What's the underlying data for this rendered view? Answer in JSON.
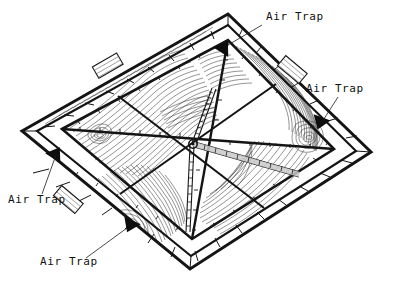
{
  "figure": {
    "kind": "engineering-diagram",
    "background_color": "#ffffff",
    "line_color": "#111111",
    "contour_color": "#333333",
    "frame_color": "#1a1a1a"
  },
  "annotations": [
    {
      "id": "air-trap-top",
      "label": "Air Trap",
      "text_x": 266,
      "text_y": 20,
      "leader": {
        "x1": 262,
        "y1": 25,
        "x2": 228,
        "y2": 45
      },
      "marker": {
        "x": 224,
        "y": 47,
        "rotation": 33
      }
    },
    {
      "id": "air-trap-right",
      "label": "Air Trap",
      "text_x": 306,
      "text_y": 92,
      "leader": {
        "x1": 338,
        "y1": 97,
        "x2": 322,
        "y2": 122
      },
      "marker": {
        "x": 320,
        "y": 123,
        "rotation": 200
      }
    },
    {
      "id": "air-trap-left",
      "label": "Air Trap",
      "text_x": 8,
      "text_y": 203,
      "leader": {
        "x1": 42,
        "y1": 194,
        "x2": 56,
        "y2": 155
      },
      "marker": {
        "x": 56,
        "y": 153,
        "rotation": 33
      }
    },
    {
      "id": "air-trap-bottom",
      "label": "Air Trap",
      "text_x": 40,
      "text_y": 265,
      "leader": {
        "x1": 86,
        "y1": 258,
        "x2": 127,
        "y2": 228
      },
      "marker": {
        "x": 130,
        "y": 226,
        "rotation": 205
      }
    }
  ],
  "frame": {
    "outer": [
      {
        "x": 22,
        "y": 131
      },
      {
        "x": 228,
        "y": 14
      },
      {
        "x": 371,
        "y": 152
      },
      {
        "x": 190,
        "y": 269
      }
    ],
    "inner": [
      {
        "x": 37,
        "y": 131
      },
      {
        "x": 228,
        "y": 25
      },
      {
        "x": 356,
        "y": 151
      },
      {
        "x": 191,
        "y": 256
      }
    ],
    "panel": [
      {
        "x": 62,
        "y": 129
      },
      {
        "x": 228,
        "y": 40
      },
      {
        "x": 334,
        "y": 149
      },
      {
        "x": 192,
        "y": 239
      }
    ]
  },
  "vents": [
    {
      "id": "vent-upper-left",
      "x": 108,
      "y": 66,
      "w": 28,
      "h": 13,
      "rotation": -30
    },
    {
      "id": "vent-upper-right",
      "x": 292,
      "y": 70,
      "w": 28,
      "h": 13,
      "rotation": 40
    },
    {
      "id": "vent-lower-left",
      "x": 68,
      "y": 200,
      "w": 28,
      "h": 13,
      "rotation": 40
    }
  ],
  "structure": {
    "hub": {
      "x": 193,
      "y": 143
    },
    "description": "central hub with radiating trusses and diagonal bracing"
  },
  "legend": {
    "marker_shape": "filled-triangle",
    "leader_style": "thin-solid"
  }
}
